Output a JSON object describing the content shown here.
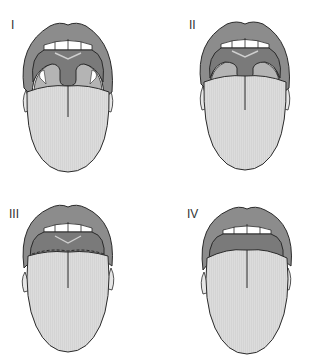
{
  "figure": {
    "panels": [
      {
        "label": "I",
        "grade": 1,
        "description": "Soft palate, uvula, fauces and tonsillar pillars visible"
      },
      {
        "label": "II",
        "grade": 2,
        "description": "Soft palate, upper uvula and fauces visible"
      },
      {
        "label": "III",
        "grade": 3,
        "description": "Soft palate and base of uvula visible"
      },
      {
        "label": "IV",
        "grade": 4,
        "description": "Only hard palate visible"
      }
    ],
    "colors": {
      "lips": "#8c8c8c",
      "palate": "#7a7a7a",
      "pharynx": "#b4b4b4",
      "tongue": "#d9d9d9",
      "teeth": "#ffffff",
      "outline": "#2a2a2a",
      "palate_line": "#cfcfcf"
    }
  }
}
